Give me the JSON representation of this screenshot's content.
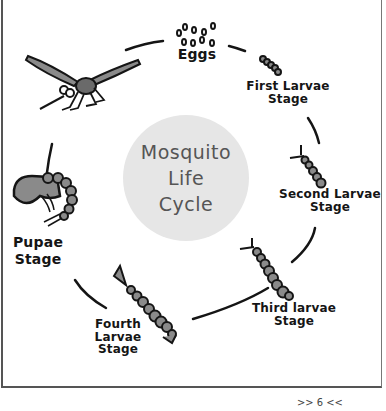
{
  "diagram": {
    "title_lines": [
      "Mosquito",
      "Life",
      "Cycle"
    ],
    "stages": [
      {
        "id": "eggs",
        "label_lines": [
          "Eggs"
        ]
      },
      {
        "id": "first-larvae",
        "label_lines": [
          "First Larvae",
          "Stage"
        ]
      },
      {
        "id": "second-larvae",
        "label_lines": [
          "Second Larvae",
          "Stage"
        ]
      },
      {
        "id": "third-larvae",
        "label_lines": [
          "Third larvae",
          "Stage"
        ]
      },
      {
        "id": "fourth-larvae",
        "label_lines": [
          "Fourth",
          "Larvae",
          "Stage"
        ]
      },
      {
        "id": "pupae",
        "label_lines": [
          "Pupae",
          "Stage"
        ]
      },
      {
        "id": "adult",
        "label_lines": []
      }
    ],
    "colors": {
      "circle_fill": "#e6e6e6",
      "body_fill": "#8a8a8a",
      "ink": "#151515",
      "title_ink": "#555555"
    }
  },
  "footer": {
    "page_number": ">> 6 <<"
  }
}
